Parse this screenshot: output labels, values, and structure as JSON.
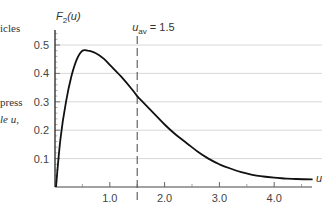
{
  "side_text": {
    "line1": "icles",
    "line2": "press",
    "line3": "le u,"
  },
  "chart_data": {
    "type": "line",
    "title": "",
    "ylabel": "F2(u)",
    "ylabel_main": "F",
    "ylabel_sub": "2",
    "ylabel_arg": "(u)",
    "xlabel": "u",
    "xlim": [
      0,
      4.8
    ],
    "ylim": [
      0,
      0.55
    ],
    "grid": "horizontal",
    "x_ticks": [
      1.0,
      2.0,
      3.0,
      4.0
    ],
    "x_tick_labels": [
      "1.0",
      "2.0",
      "3.0",
      "4.0"
    ],
    "y_ticks": [
      0.1,
      0.2,
      0.3,
      0.4,
      0.5
    ],
    "y_tick_labels": [
      "0.1",
      "0.2",
      "0.3",
      "0.4",
      "0.5"
    ],
    "annotation": {
      "label_main": "u",
      "label_sub": "av",
      "label_value": " = 1.5",
      "x": 1.5,
      "style": "dashed-vertical"
    },
    "series": [
      {
        "name": "F2(u)",
        "x": [
          0.02,
          0.1,
          0.2,
          0.3,
          0.4,
          0.5,
          0.6,
          0.7,
          0.8,
          0.9,
          1.0,
          1.2,
          1.4,
          1.5,
          1.6,
          1.8,
          2.0,
          2.2,
          2.4,
          2.6,
          2.8,
          3.0,
          3.2,
          3.4,
          3.6,
          3.8,
          4.0,
          4.2,
          4.4,
          4.7
        ],
        "values": [
          0.0,
          0.17,
          0.3,
          0.39,
          0.45,
          0.48,
          0.48,
          0.475,
          0.465,
          0.45,
          0.43,
          0.39,
          0.345,
          0.32,
          0.3,
          0.26,
          0.22,
          0.185,
          0.155,
          0.125,
          0.1,
          0.08,
          0.065,
          0.052,
          0.043,
          0.037,
          0.033,
          0.03,
          0.028,
          0.027
        ]
      }
    ]
  }
}
